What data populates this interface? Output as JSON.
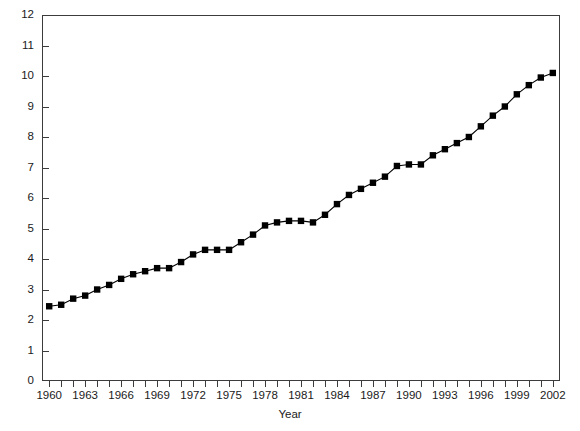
{
  "chart_data": {
    "type": "line",
    "title": "",
    "xlabel": "Year",
    "ylabel": "",
    "xlim": [
      1959.4,
      2002.6
    ],
    "ylim": [
      0,
      12
    ],
    "grid": false,
    "legend": null,
    "marker": "square",
    "line_color": "#000000",
    "marker_color": "#000000",
    "x_tick_step": 1,
    "x_label_step": 3,
    "y_tick_step": 1,
    "x_tick_labels": [
      "1960",
      "1963",
      "1966",
      "1969",
      "1972",
      "1975",
      "1978",
      "1981",
      "1984",
      "1987",
      "1990",
      "1993",
      "1996",
      "1999",
      "2002"
    ],
    "y_tick_labels": [
      "0",
      "1",
      "2",
      "3",
      "4",
      "5",
      "6",
      "7",
      "8",
      "9",
      "10",
      "11",
      "12"
    ],
    "x": [
      1960,
      1961,
      1962,
      1963,
      1964,
      1965,
      1966,
      1967,
      1968,
      1969,
      1970,
      1971,
      1972,
      1973,
      1974,
      1975,
      1976,
      1977,
      1978,
      1979,
      1980,
      1981,
      1982,
      1983,
      1984,
      1985,
      1986,
      1987,
      1988,
      1989,
      1990,
      1991,
      1992,
      1993,
      1994,
      1995,
      1996,
      1997,
      1998,
      1999,
      2000,
      2001,
      2002
    ],
    "values": [
      2.45,
      2.5,
      2.7,
      2.8,
      3.0,
      3.15,
      3.35,
      3.5,
      3.6,
      3.7,
      3.7,
      3.9,
      4.15,
      4.3,
      4.3,
      4.3,
      4.55,
      4.8,
      5.1,
      5.2,
      5.25,
      5.25,
      5.2,
      5.45,
      5.8,
      6.1,
      6.3,
      6.5,
      6.7,
      7.05,
      7.1,
      7.1,
      7.4,
      7.6,
      7.8,
      8.0,
      8.35,
      8.7,
      9.0,
      9.4,
      9.7,
      9.95,
      10.1
    ]
  },
  "axis": {
    "x_title": "Year"
  }
}
